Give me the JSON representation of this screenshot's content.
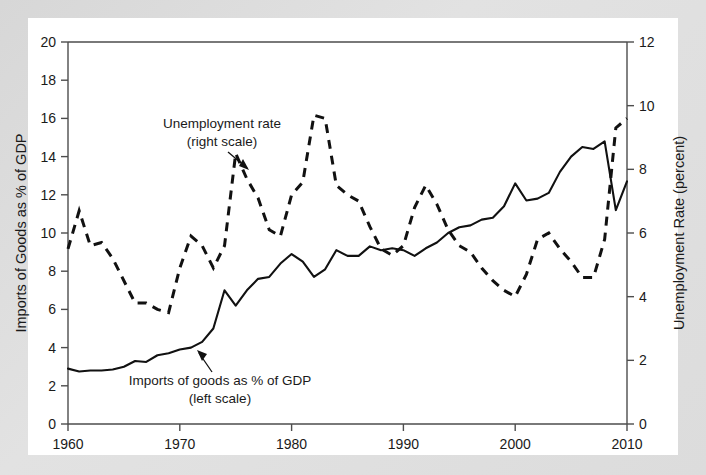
{
  "chart_data": {
    "type": "line",
    "title": "",
    "xlabel": "",
    "x_ticks": [
      1960,
      1970,
      1980,
      1990,
      2000,
      2010
    ],
    "xlim": [
      1960,
      2010
    ],
    "grid": false,
    "legend_position": "inline-annotations",
    "axes": {
      "left": {
        "label": "Imports of Goods as % of GDP",
        "ticks": [
          0,
          2,
          4,
          6,
          8,
          10,
          12,
          14,
          16,
          18,
          20
        ],
        "lim": [
          0,
          20
        ]
      },
      "right": {
        "label": "Unemployment Rate (percent)",
        "ticks": [
          0,
          2,
          4,
          6,
          8,
          10,
          12
        ],
        "lim": [
          0,
          12
        ]
      }
    },
    "annotations": [
      {
        "name": "unemployment-annotation",
        "line1": "Unemployment rate",
        "line2": "(right scale)"
      },
      {
        "name": "imports-annotation",
        "line1": "Imports of goods as % of GDP",
        "line2": "(left scale)"
      }
    ],
    "x": [
      1960,
      1961,
      1962,
      1963,
      1964,
      1965,
      1966,
      1967,
      1968,
      1969,
      1970,
      1971,
      1972,
      1973,
      1974,
      1975,
      1976,
      1977,
      1978,
      1979,
      1980,
      1981,
      1982,
      1983,
      1984,
      1985,
      1986,
      1987,
      1988,
      1989,
      1990,
      1991,
      1992,
      1993,
      1994,
      1995,
      1996,
      1997,
      1998,
      1999,
      2000,
      2001,
      2002,
      2003,
      2004,
      2005,
      2006,
      2007,
      2008,
      2009,
      2010
    ],
    "series": [
      {
        "name": "Imports of goods as % of GDP",
        "axis": "left",
        "style": "solid",
        "unit": "percent of GDP",
        "values": [
          2.9,
          2.75,
          2.8,
          2.8,
          2.85,
          3.0,
          3.3,
          3.25,
          3.6,
          3.7,
          3.9,
          4.0,
          4.3,
          5.0,
          7.0,
          6.2,
          7.0,
          7.6,
          7.7,
          8.4,
          8.9,
          8.5,
          7.7,
          8.1,
          9.1,
          8.8,
          8.8,
          9.3,
          9.1,
          9.2,
          9.1,
          8.8,
          9.2,
          9.5,
          10.0,
          10.3,
          10.4,
          10.7,
          10.8,
          11.4,
          12.6,
          11.7,
          11.8,
          12.1,
          13.2,
          14.0,
          14.5,
          14.4,
          14.8,
          11.2,
          12.7
        ]
      },
      {
        "name": "Unemployment rate",
        "axis": "right",
        "style": "dashed",
        "unit": "percent",
        "values": [
          5.5,
          6.7,
          5.6,
          5.7,
          5.2,
          4.5,
          3.8,
          3.8,
          3.6,
          3.5,
          4.9,
          5.9,
          5.6,
          4.9,
          5.6,
          8.5,
          7.7,
          7.1,
          6.1,
          5.9,
          7.2,
          7.6,
          9.7,
          9.6,
          7.5,
          7.2,
          7.0,
          6.2,
          5.5,
          5.3,
          5.6,
          6.8,
          7.5,
          6.9,
          6.1,
          5.6,
          5.4,
          4.9,
          4.5,
          4.2,
          4.0,
          4.7,
          5.8,
          6.0,
          5.5,
          5.1,
          4.6,
          4.6,
          5.8,
          9.3,
          9.6
        ]
      }
    ]
  },
  "plot": {
    "left_px": 68,
    "right_px": 627,
    "top_px": 42,
    "bottom_px": 424
  }
}
